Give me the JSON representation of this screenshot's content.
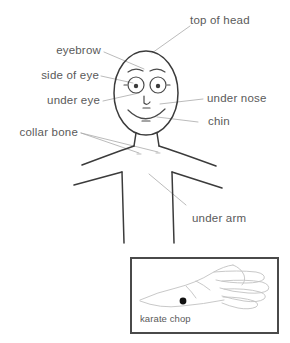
{
  "diagram": {
    "background_color": "#ffffff",
    "line_color": "#3b3b3b",
    "label_color": "#5a5a5a",
    "leader_color": "#a9a9a9",
    "marker_color": "#111111",
    "labels": [
      {
        "id": "top-of-head",
        "text": "top of head",
        "side": "right"
      },
      {
        "id": "eyebrow",
        "text": "eyebrow",
        "side": "left"
      },
      {
        "id": "side-of-eye",
        "text": "side of eye",
        "side": "left"
      },
      {
        "id": "under-eye",
        "text": "under eye",
        "side": "left"
      },
      {
        "id": "under-nose",
        "text": "under nose",
        "side": "right"
      },
      {
        "id": "chin",
        "text": "chin",
        "side": "right"
      },
      {
        "id": "collar-bone",
        "text": "collar bone",
        "side": "left"
      },
      {
        "id": "under-arm",
        "text": "under arm",
        "side": "right"
      }
    ],
    "inset": {
      "name": "hand-inset",
      "label": "karate chop",
      "marker": "point-dot"
    }
  }
}
